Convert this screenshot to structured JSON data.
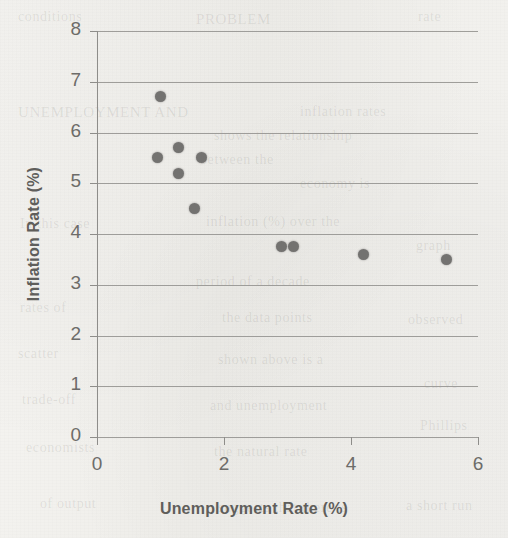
{
  "chart_data": {
    "type": "scatter",
    "title": "",
    "xlabel": "Unemployment Rate (%)",
    "ylabel": "Inflation Rate (%)",
    "xlim": [
      0,
      6
    ],
    "ylim": [
      0,
      8
    ],
    "xticks": [
      "0",
      "2",
      "4",
      "6"
    ],
    "xtick_values": [
      0,
      2,
      4,
      6
    ],
    "yticks": [
      "0",
      "1",
      "2",
      "3",
      "4",
      "5",
      "6",
      "7",
      "8"
    ],
    "ytick_values": [
      0,
      1,
      2,
      3,
      4,
      5,
      6,
      7,
      8
    ],
    "grid": "horizontal",
    "legend": "none",
    "marker_color": "#737270",
    "series": [
      {
        "name": "Unemployment vs Inflation",
        "points": [
          {
            "x": 1.0,
            "y": 6.7
          },
          {
            "x": 0.95,
            "y": 5.5
          },
          {
            "x": 1.28,
            "y": 5.7
          },
          {
            "x": 1.28,
            "y": 5.2
          },
          {
            "x": 1.65,
            "y": 5.5
          },
          {
            "x": 1.53,
            "y": 4.5
          },
          {
            "x": 2.9,
            "y": 3.75
          },
          {
            "x": 3.1,
            "y": 3.75
          },
          {
            "x": 4.2,
            "y": 3.6
          },
          {
            "x": 5.5,
            "y": 3.5
          }
        ]
      }
    ]
  },
  "background": {
    "ghost_text": [
      {
        "text": "conditions",
        "x": 18,
        "y": 9,
        "size": 14,
        "rot": 0
      },
      {
        "text": "PROBLEM",
        "x": 196,
        "y": 11,
        "size": 15,
        "rot": 0
      },
      {
        "text": "rate",
        "x": 418,
        "y": 9,
        "size": 14,
        "rot": 0
      },
      {
        "text": "UNEMPLOYMENT AND",
        "x": 18,
        "y": 104,
        "size": 15,
        "rot": 0
      },
      {
        "text": "inflation rates",
        "x": 300,
        "y": 104,
        "size": 14,
        "rot": 0
      },
      {
        "text": "shows the relationship",
        "x": 214,
        "y": 128,
        "size": 14,
        "rot": 0
      },
      {
        "text": "between the",
        "x": 200,
        "y": 152,
        "size": 14,
        "rot": 0
      },
      {
        "text": "economy is",
        "x": 300,
        "y": 176,
        "size": 14,
        "rot": 0
      },
      {
        "text": "inflation (%) over the",
        "x": 206,
        "y": 214,
        "size": 14,
        "rot": 0
      },
      {
        "text": "In this case",
        "x": 20,
        "y": 216,
        "size": 14,
        "rot": 0
      },
      {
        "text": "graph",
        "x": 416,
        "y": 238,
        "size": 14,
        "rot": 0
      },
      {
        "text": "period of a decade",
        "x": 196,
        "y": 274,
        "size": 14,
        "rot": 0
      },
      {
        "text": "rates of",
        "x": 20,
        "y": 300,
        "size": 14,
        "rot": 0
      },
      {
        "text": "the data points",
        "x": 222,
        "y": 310,
        "size": 14,
        "rot": 0
      },
      {
        "text": "observed",
        "x": 408,
        "y": 312,
        "size": 14,
        "rot": 0
      },
      {
        "text": "scatter",
        "x": 18,
        "y": 346,
        "size": 14,
        "rot": 0
      },
      {
        "text": "shown above is a",
        "x": 218,
        "y": 352,
        "size": 14,
        "rot": 0
      },
      {
        "text": "curve",
        "x": 424,
        "y": 376,
        "size": 14,
        "rot": 0
      },
      {
        "text": "trade-off",
        "x": 22,
        "y": 392,
        "size": 14,
        "rot": 0
      },
      {
        "text": "and unemployment",
        "x": 210,
        "y": 398,
        "size": 14,
        "rot": 0
      },
      {
        "text": "Phillips",
        "x": 420,
        "y": 418,
        "size": 14,
        "rot": 0
      },
      {
        "text": "economists",
        "x": 26,
        "y": 440,
        "size": 14,
        "rot": 0
      },
      {
        "text": "the natural rate",
        "x": 214,
        "y": 444,
        "size": 14,
        "rot": 0
      },
      {
        "text": "of output",
        "x": 40,
        "y": 496,
        "size": 14,
        "rot": 0
      },
      {
        "text": "suggests that there is",
        "x": 218,
        "y": 500,
        "size": 14,
        "rot": 0
      },
      {
        "text": "a short run",
        "x": 406,
        "y": 498,
        "size": 14,
        "rot": 0
      }
    ]
  }
}
